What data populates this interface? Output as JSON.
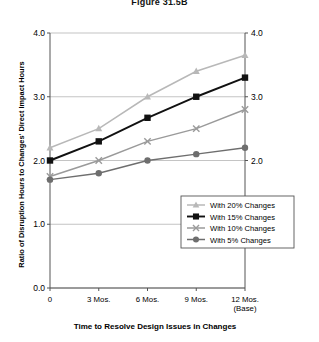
{
  "figure": {
    "title": "Figure 31.5B"
  },
  "chart_data": {
    "type": "line",
    "title": "Figure 31.5B",
    "xlabel": "Time to Resolve Design Issues in Changes",
    "ylabel": "Ratio of Disruption Hours to Changes' Direct Impact Hours",
    "categories": [
      "0",
      "3 Mos.",
      "6 Mos.",
      "9 Mos.",
      "12 Mos. (Base)"
    ],
    "x_tick_labels": [
      "0",
      "3 Mos.",
      "6 Mos.",
      "9 Mos.",
      "12 Mos."
    ],
    "x_tick_sublabels": [
      "",
      "",
      "",
      "",
      "(Base)"
    ],
    "y_tick_labels": [
      "0.0",
      "1.0",
      "2.0",
      "3.0",
      "4.0"
    ],
    "y_tick_values": [
      0.0,
      1.0,
      2.0,
      3.0,
      4.0
    ],
    "ylim": [
      0.0,
      4.0
    ],
    "grid": true,
    "legend_position": "bottom-right",
    "right_axis_labels": [
      "2.0",
      "3.0",
      "4.0"
    ],
    "series": [
      {
        "name": "With 20% Changes",
        "values": [
          2.2,
          2.5,
          3.0,
          3.4,
          3.65
        ],
        "color": "#b8b8b8",
        "marker": "triangle"
      },
      {
        "name": "With 15% Changes",
        "values": [
          2.0,
          2.3,
          2.67,
          3.0,
          3.3
        ],
        "color": "#111111",
        "marker": "square"
      },
      {
        "name": "With 10% Changes",
        "values": [
          1.75,
          2.0,
          2.3,
          2.5,
          2.8
        ],
        "color": "#9a9a9a",
        "marker": "x"
      },
      {
        "name": "With 5% Changes",
        "values": [
          1.7,
          1.8,
          2.0,
          2.1,
          2.2
        ],
        "color": "#6e6e6e",
        "marker": "circle"
      }
    ]
  },
  "legend": {
    "items": [
      {
        "label": "With 20% Changes"
      },
      {
        "label": "With 15% Changes"
      },
      {
        "label": "With 10% Changes"
      },
      {
        "label": "With 5% Changes"
      }
    ]
  },
  "colors": {
    "axis": "#555555",
    "grid": "#aaaaaa",
    "background": "#ffffff"
  }
}
